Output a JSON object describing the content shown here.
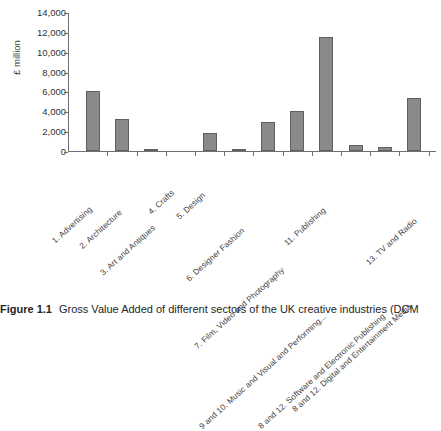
{
  "figure": {
    "caption_label": "Figure 1.1",
    "caption_text": "Gross Value Added of different sectors of the UK creative industries (DCM"
  },
  "chart_data": {
    "type": "bar",
    "title": "",
    "xlabel": "",
    "ylabel": "£ million",
    "ylim": [
      0,
      14000
    ],
    "ytick_step": 2000,
    "grid": false,
    "legend": "none",
    "ytick_labels": [
      "14,000",
      "12,000",
      "10,000",
      "8,000",
      "6,000",
      "4,000",
      "2,000",
      "0"
    ],
    "ytick_values": [
      14000,
      12000,
      10000,
      8000,
      6000,
      4000,
      2000,
      0
    ],
    "categories": [
      "1. Advertising",
      "2. Architecture",
      "3. Art and Antiques",
      "4. Crafts",
      "5. Design",
      "6. Designer Fashion",
      "7. Film, Video and Photography",
      "9 and 10. Music and Visual and Performing...",
      "11. Publishing",
      "8 and 12. Software and Electronic Publishing",
      "8 and 12. Digital and Entertainment Media",
      "13. TV and Radio"
    ],
    "values": [
      6000,
      3250,
      250,
      0,
      1850,
      150,
      2900,
      4050,
      11500,
      600,
      450,
      5300
    ],
    "bar_color": "#8a8a8a",
    "bar_edge_color": "#5f5f5f"
  }
}
